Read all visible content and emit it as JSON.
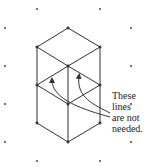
{
  "diagram": {
    "type": "isometric-dot-grid",
    "stroke_color": "#333333",
    "dot_color": "#333333",
    "grid_dots": [
      [
        37,
        9
      ],
      [
        100,
        9
      ],
      [
        5,
        28
      ],
      [
        131,
        28
      ],
      [
        5,
        66
      ],
      [
        131,
        66
      ],
      [
        5,
        104
      ],
      [
        131,
        104
      ],
      [
        5,
        142
      ],
      [
        131,
        142
      ],
      [
        37,
        161
      ],
      [
        100,
        161
      ]
    ],
    "vertices": {
      "top": [
        68,
        28
      ],
      "upper_left": [
        37,
        47
      ],
      "upper_right": [
        100,
        47
      ],
      "center_top": [
        68,
        66
      ],
      "mid_left": [
        37,
        85
      ],
      "mid_right": [
        100,
        85
      ],
      "center_mid": [
        68,
        104
      ],
      "lower_left": [
        37,
        123
      ],
      "lower_right": [
        100,
        123
      ],
      "bottom": [
        68,
        142
      ]
    },
    "annotation": {
      "lines": [
        "These",
        "lines",
        "are not",
        "needed."
      ]
    }
  }
}
